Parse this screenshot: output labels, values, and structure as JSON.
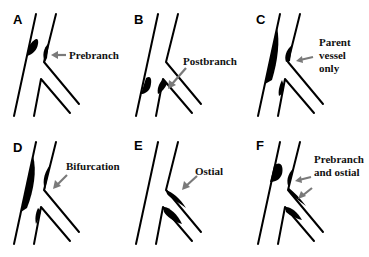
{
  "figure": {
    "panels": [
      {
        "letter": "A",
        "label_lines": [
          "Prebranch"
        ]
      },
      {
        "letter": "B",
        "label_lines": [
          "Postbranch"
        ]
      },
      {
        "letter": "C",
        "label_lines": [
          "Parent",
          "vessel",
          "only"
        ]
      },
      {
        "letter": "D",
        "label_lines": [
          "Bifurcation"
        ]
      },
      {
        "letter": "E",
        "label_lines": [
          "Ostial"
        ]
      },
      {
        "letter": "F",
        "label_lines": [
          "Prebranch",
          "and ostial"
        ]
      }
    ],
    "colors": {
      "vessel_wall": "#000000",
      "plaque": "#000000",
      "arrow": "#7a7a7a",
      "background": "#ffffff"
    }
  }
}
